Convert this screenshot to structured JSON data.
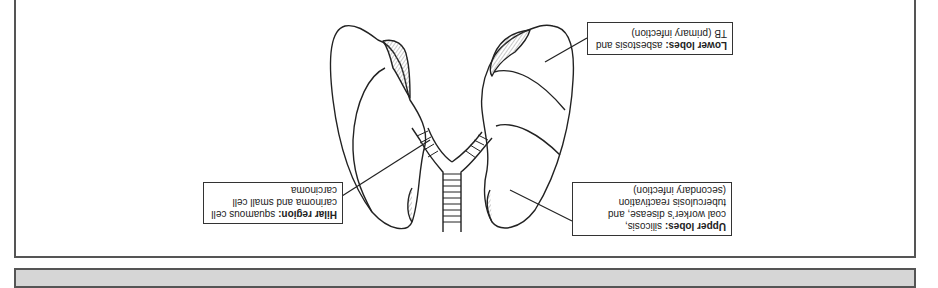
{
  "orientation": "rotated-180",
  "labels": {
    "hilar": {
      "title": "Hilar region:",
      "line1_rest": " squamous cell",
      "line2": "carinoma and small cell",
      "line3": "carcinoma"
    },
    "upper": {
      "title": "Upper lobes:",
      "line1_rest": " silicosis,",
      "line2": "coal worker’s disease, and",
      "line3": "tuberculosis reactivation",
      "line4": "(secondary infection)"
    },
    "lower": {
      "title": "Lower lobes:",
      "line1_rest": " asbestosis and",
      "line2": "TB (primary infection)"
    }
  },
  "colors": {
    "panel_border": "#555555",
    "footer_fill": "#d6d6d6",
    "line": "#222222",
    "hatch": "#777777"
  }
}
